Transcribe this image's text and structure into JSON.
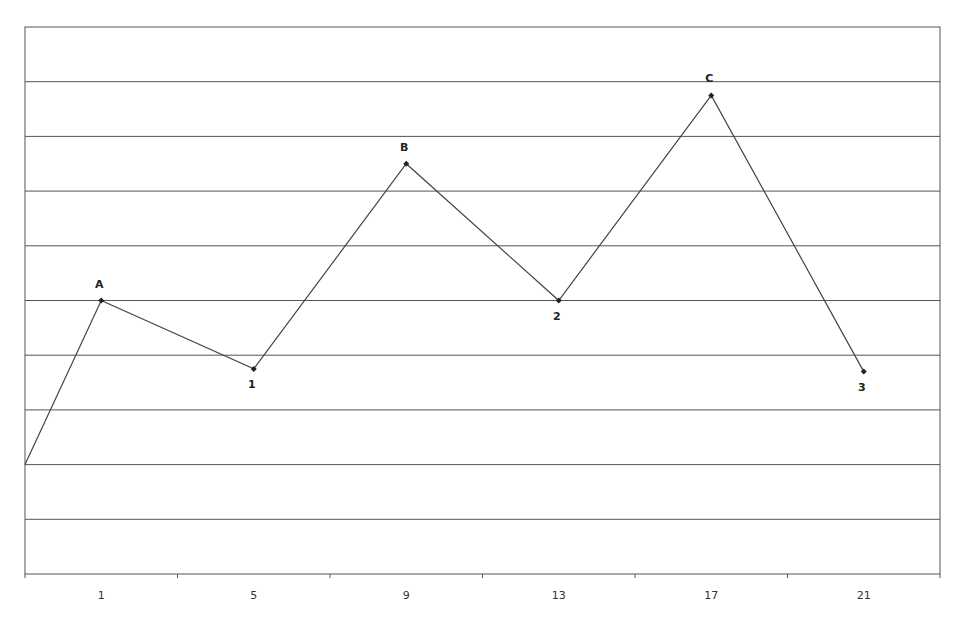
{
  "chart_data": {
    "type": "line",
    "title": "",
    "xlabel": "",
    "ylabel": "",
    "categories": [
      "1",
      "5",
      "9",
      "13",
      "17",
      "21"
    ],
    "x_tick_labels": [
      "1",
      "5",
      "9",
      "13",
      "17",
      "21"
    ],
    "ylim": [
      0,
      10
    ],
    "y_gridlines": 10,
    "grid": true,
    "legend": null,
    "start_point": {
      "x_position": "left-edge",
      "value": 2.0
    },
    "series": [
      {
        "name": "Price",
        "color": "#444444",
        "points": [
          {
            "x": "1",
            "value": 5.0,
            "label": "A",
            "label_position": "above"
          },
          {
            "x": "5",
            "value": 3.75,
            "label": "1",
            "label_position": "below"
          },
          {
            "x": "9",
            "value": 7.5,
            "label": "B",
            "label_position": "above"
          },
          {
            "x": "13",
            "value": 5.0,
            "label": "2",
            "label_position": "below"
          },
          {
            "x": "17",
            "value": 8.75,
            "label": "C",
            "label_position": "above"
          },
          {
            "x": "21",
            "value": 3.7,
            "label": "3",
            "label_position": "below"
          }
        ]
      }
    ],
    "colors": {
      "line": "#444444",
      "grid": "#555555",
      "axis": "#555555",
      "marker": "#222222"
    }
  }
}
